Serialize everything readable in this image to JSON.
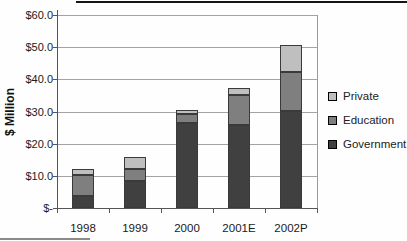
{
  "chart_data": {
    "type": "bar",
    "stacked": true,
    "title": "",
    "ylabel": "$ Million",
    "xlabel": "",
    "categories": [
      "1998",
      "1999",
      "2000",
      "2001E",
      "2002P"
    ],
    "series": [
      {
        "name": "Government",
        "color": "#404040",
        "values": [
          3.8,
          8.5,
          26.3,
          25.7,
          30.3
        ]
      },
      {
        "name": "Education",
        "color": "#7f7f7f",
        "values": [
          6.4,
          3.6,
          3.0,
          9.4,
          12.0
        ]
      },
      {
        "name": "Private",
        "color": "#bfbfbf",
        "values": [
          1.9,
          3.8,
          1.2,
          2.3,
          8.3
        ]
      }
    ],
    "totals": [
      12.1,
      15.9,
      30.5,
      37.4,
      50.6
    ],
    "ylim": [
      0,
      60
    ],
    "ytick_interval": 10,
    "ytick_labels": [
      "$-",
      "$10.0",
      "$20.0",
      "$30.0",
      "$40.0",
      "$50.0",
      "$60.0"
    ],
    "grid": true,
    "legend_position": "right",
    "legend_order": [
      "Private",
      "Education",
      "Government"
    ]
  }
}
